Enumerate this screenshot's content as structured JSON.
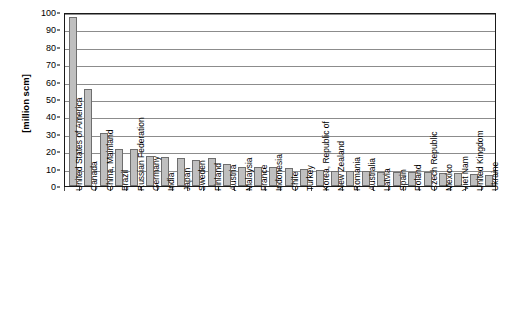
{
  "chart": {
    "y_axis_title": "[million scm]",
    "y_ticks": [
      "0",
      "10",
      "20",
      "30",
      "40",
      "50",
      "60",
      "70",
      "80",
      "90",
      "100"
    ]
  },
  "chart_data": {
    "type": "bar",
    "title": "",
    "subtitle": "",
    "xlabel": "",
    "ylabel": "[million scm]",
    "ylim": [
      0,
      100
    ],
    "ytick_step": 10,
    "grid": true,
    "legend": "none",
    "orientation": "vertical",
    "bar_fill_color": "#bfbfbf",
    "bar_border_color": "#6e6e6e",
    "categories": [
      "United States of America",
      "Canada",
      "China, Mainland",
      "Brazil",
      "Russian Federation",
      "Germany",
      "India",
      "Japan",
      "Sweden",
      "Finland",
      "Austria",
      "Malaysia",
      "France",
      "Indonesia",
      "Chile",
      "Turkey",
      "Korea, Republic of",
      "New Zealand",
      "Romania",
      "Australia",
      "Latvia",
      "Spain",
      "Poland",
      "Czech Republic",
      "Mexico",
      "Viet Nam",
      "United Kingdom",
      "Ukraine"
    ],
    "values": [
      97,
      56,
      30.5,
      21.5,
      21,
      17.5,
      16.5,
      16,
      15,
      16,
      12.5,
      11,
      11,
      11,
      10.5,
      10,
      9,
      8.5,
      8.5,
      8.5,
      8,
      8,
      8,
      8,
      7.5,
      7.5,
      7,
      6.5
    ]
  }
}
